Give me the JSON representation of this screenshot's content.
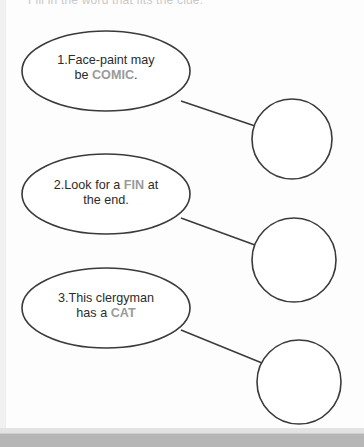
{
  "worksheet": {
    "clipped_header_text": "Fill in the word that fits the clue.",
    "items": [
      {
        "number": "1.",
        "text_before": "Face-paint may",
        "line2_before": "be ",
        "highlight": "COMIC",
        "line2_after": ".",
        "answer_value": ""
      },
      {
        "number": "2.",
        "text_before": "Look for a ",
        "highlight": "FIN",
        "text_after": " at",
        "line2": "the end.",
        "answer_value": ""
      },
      {
        "number": "3.",
        "text_before": "This clergyman",
        "line2_before": "has a ",
        "highlight": "CAT",
        "line2_after": "",
        "answer_value": ""
      }
    ],
    "colors": {
      "outline": "#3a3a3a",
      "highlight_text": "#9a9a9a",
      "body_text": "#2b2b2b",
      "page_background": "#fdfdfd",
      "desk_background": "#b6b6b6"
    }
  }
}
